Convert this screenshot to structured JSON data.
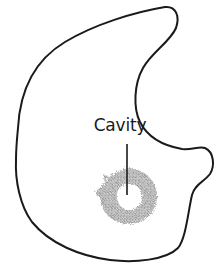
{
  "diagram": {
    "labels": [
      {
        "text": "Cavity",
        "target": "cavity-lesion"
      }
    ]
  },
  "colors": {
    "outline": "#1a1a1a",
    "cavity_fill": "#b8b8b8",
    "background": "#ffffff",
    "text": "#1a1a1a"
  }
}
